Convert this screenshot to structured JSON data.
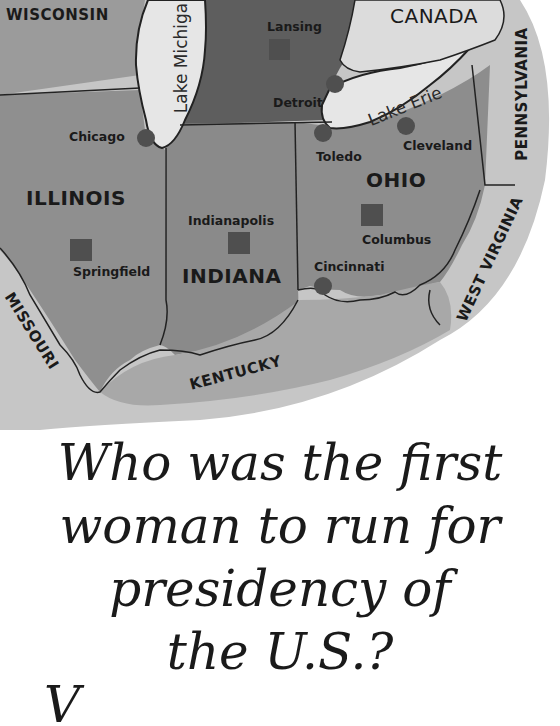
{
  "map": {
    "states": {
      "wisconsin": "WISCONSIN",
      "illinois": "ILLINOIS",
      "indiana": "INDIANA",
      "ohio": "OHIO",
      "pennsylvania": "PENNSYLVANIA",
      "west_virginia": "WEST VIRGINIA",
      "kentucky": "KENTUCKY",
      "missouri": "MISSOURI"
    },
    "countries": {
      "canada": "CANADA"
    },
    "water_bodies": {
      "lake_michigan": "Lake Michiga",
      "lake_erie": "Lake Erie"
    },
    "cities": {
      "lansing": "Lansing",
      "detroit": "Detroit",
      "chicago": "Chicago",
      "toledo": "Toledo",
      "cleveland": "Cleveland",
      "indianapolis": "Indianapolis",
      "springfield": "Springfield",
      "columbus": "Columbus",
      "cincinnati": "Cincinnati"
    },
    "legend": {
      "capital_marker": "square",
      "city_marker": "circle"
    },
    "colors": {
      "land_dark": "#5e5e5e",
      "land_mid": "#8a8a8a",
      "land_light": "#a6a6a6",
      "water": "#e4e4e4",
      "marker": "#4a4a4a",
      "border": "#2a2a2a"
    }
  },
  "question": {
    "line1": "Who was the first",
    "line2": "woman to run for",
    "line3": "presidency of",
    "line4": "the U.S.?",
    "answer_partial": "V"
  }
}
